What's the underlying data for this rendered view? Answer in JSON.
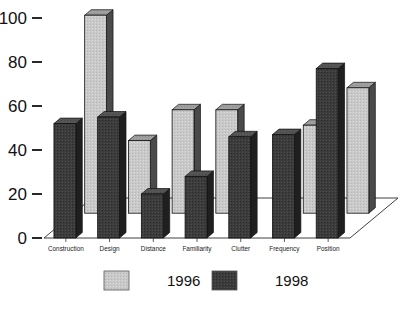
{
  "chart_data": {
    "type": "bar",
    "title": "",
    "subtitle": "",
    "xlabel": "",
    "ylabel": "",
    "ylim": [
      0,
      100
    ],
    "yticks": [
      0,
      20,
      40,
      60,
      80,
      100
    ],
    "ytick_labels": [
      "0",
      "20",
      "40",
      "60",
      "80",
      "100"
    ],
    "grid": true,
    "three_d": true,
    "legend_position": "bottom",
    "categories": [
      "Construction",
      "Design",
      "Distance",
      "Familiarity",
      "Clutter",
      "Frequency",
      "Position"
    ],
    "series": [
      {
        "name": "1996",
        "color": "#c9c9c9",
        "values": [
          90,
          33,
          47,
          47,
          0,
          40,
          57
        ]
      },
      {
        "name": "1998",
        "color": "#3c3c3c",
        "values": [
          52,
          55,
          20,
          28,
          46,
          47,
          77
        ]
      }
    ]
  },
  "axis": {
    "y_tick_labels": [
      "100",
      "80",
      "60",
      "40",
      "20",
      "0"
    ]
  },
  "legend": {
    "entries": [
      {
        "label": "1996",
        "swatch_color": "#c9c9c9"
      },
      {
        "label": "1998",
        "swatch_color": "#3c3c3c"
      }
    ]
  },
  "colors": {
    "series_1996": "#c9c9c9",
    "series_1996_side": "#4a4a4a",
    "series_1996_top": "#9a9a9a",
    "series_1998": "#3c3c3c",
    "series_1998_side": "#232323",
    "series_1998_top": "#555555",
    "axis": "#111111",
    "grid": "#8a8a8a",
    "background": "#ffffff"
  }
}
